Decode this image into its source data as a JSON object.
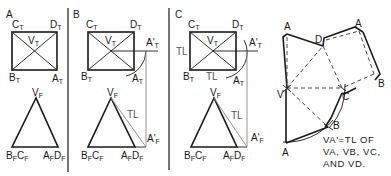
{
  "figure": {
    "panels": [
      {
        "id": "A",
        "label": "A",
        "top_view": {
          "labels": {
            "CT": "C",
            "DT": "D",
            "VT": "V",
            "BT": "B",
            "AT": "A"
          },
          "subscript": "T"
        },
        "front_view": {
          "labels": {
            "VF": "V",
            "BFCF_1": "B",
            "BFCF_2": "C",
            "AFDF_1": "A",
            "AFDF_2": "D"
          },
          "subscript": "F"
        }
      },
      {
        "id": "B",
        "label": "B",
        "top_view": {
          "prime_label": "A'",
          "subscript": "T"
        },
        "front_view": {
          "prime_label": "A'",
          "subscript": "F",
          "tl_label": "TL"
        }
      },
      {
        "id": "C",
        "label": "C",
        "top_view": {
          "prime_label": "A'",
          "subscript": "T",
          "tl_left": "TL",
          "tl_bottom": "TL"
        },
        "front_view": {
          "prime_label": "A'",
          "subscript": "F",
          "tl_label": "TL"
        }
      }
    ],
    "pattern": {
      "vertex_labels": {
        "a_top_left": "A",
        "d": "D",
        "a_top_right": "A",
        "b_right": "B",
        "c": "C",
        "v": "V",
        "b_bottom": "B",
        "a_bottom": "A"
      },
      "note_lines": [
        "VA'=TL OF",
        "VA, VB, VC,",
        "AND VD."
      ]
    },
    "colors": {
      "ink": "#1a1a1a",
      "projection": "#8a8a8a",
      "background": "#ffffff"
    }
  },
  "labels": {
    "C": "C",
    "D": "D",
    "V": "V",
    "B": "B",
    "A": "A",
    "T": "T",
    "F": "F",
    "Aprime": "A'",
    "TL": "TL"
  }
}
